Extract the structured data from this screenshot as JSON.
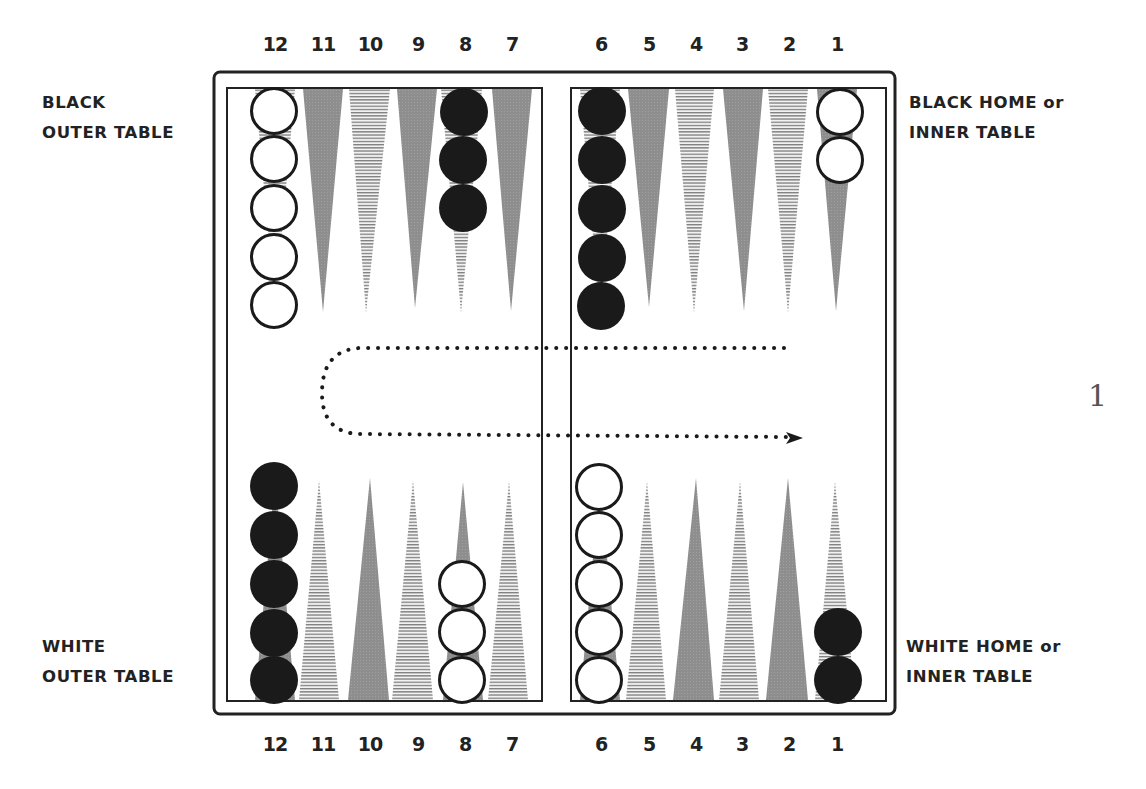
{
  "board": {
    "top_point_numbers": [
      "12",
      "11",
      "10",
      "9",
      "8",
      "7",
      "6",
      "5",
      "4",
      "3",
      "2",
      "1"
    ],
    "bottom_point_numbers": [
      "12",
      "11",
      "10",
      "9",
      "8",
      "7",
      "6",
      "5",
      "4",
      "3",
      "2",
      "1"
    ],
    "labels": {
      "top_left": [
        "BLACK",
        "OUTER TABLE"
      ],
      "top_right": [
        "BLACK HOME or",
        "INNER TABLE"
      ],
      "bottom_left": [
        "WHITE",
        "OUTER TABLE"
      ],
      "bottom_right": [
        "WHITE HOME or",
        "INNER TABLE"
      ]
    },
    "checkers": {
      "top": [
        {
          "point": "12",
          "color": "white",
          "count": 5
        },
        {
          "point": "8",
          "color": "black",
          "count": 3
        },
        {
          "point": "6",
          "color": "black",
          "count": 5
        },
        {
          "point": "1",
          "color": "white",
          "count": 2
        }
      ],
      "bottom": [
        {
          "point": "12",
          "color": "black",
          "count": 5
        },
        {
          "point": "8",
          "color": "white",
          "count": 3
        },
        {
          "point": "6",
          "color": "white",
          "count": 5
        },
        {
          "point": "1",
          "color": "black",
          "count": 2
        }
      ]
    },
    "movement_arrow": "dotted U-shaped path from top-right, around left, to bottom-right with arrowhead"
  },
  "page": {
    "side_number": "1"
  },
  "colors": {
    "gray_point": "#8c8c8c",
    "striped_point_line": "#7a7a7a",
    "black_checker": "#1a1a1a",
    "frame": "#222222"
  }
}
